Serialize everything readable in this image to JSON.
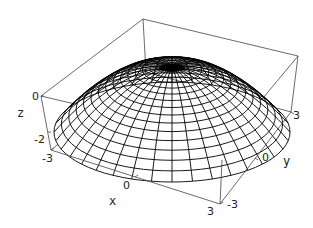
{
  "chart_data": {
    "type": "surface3d",
    "title": "",
    "xlabel": "x",
    "ylabel": "y",
    "zlabel": "z",
    "x_ticks": [
      "-3",
      "0",
      "3"
    ],
    "y_ticks": [
      "-3",
      "0",
      "3"
    ],
    "z_ticks": [
      "0",
      "-2"
    ],
    "xlim": [
      -3,
      3
    ],
    "ylim": [
      -3,
      3
    ],
    "zlim": [
      -3,
      0
    ],
    "grid": false,
    "boxed": true,
    "mesh": "polar",
    "radial_lines": 36,
    "rings": 16,
    "line_color": "#000000",
    "face_color": "#ffffff"
  },
  "labels": {
    "x_axis": "x",
    "y_axis": "y",
    "z_axis": "z",
    "x_tick_0": "-3",
    "x_tick_1": "0",
    "x_tick_2": "3",
    "y_tick_0": "-3",
    "y_tick_1": "0",
    "y_tick_2": "3",
    "z_tick_0": "0",
    "z_tick_1": "-2",
    "x_first_tick": "-3"
  }
}
